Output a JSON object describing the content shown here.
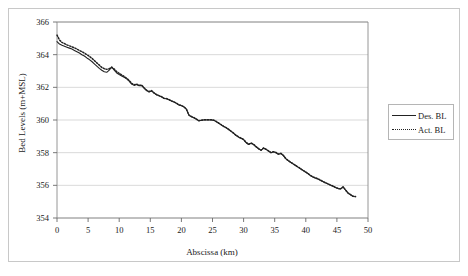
{
  "chart_data": {
    "type": "line",
    "title": "",
    "xlabel": "Abscissa (km)",
    "ylabel": "Bed Levels (m+MSL)",
    "xlim": [
      0,
      50
    ],
    "ylim": [
      354,
      366
    ],
    "xticks": [
      0,
      5,
      10,
      15,
      20,
      25,
      30,
      35,
      40,
      45,
      50
    ],
    "yticks": [
      354,
      356,
      358,
      360,
      362,
      364,
      366
    ],
    "grid": "horizontal",
    "legend_position": "right",
    "series": [
      {
        "name": "Des. BL",
        "style": "solid",
        "color": "#222222",
        "x": [
          0.0,
          0.4,
          0.8,
          1.2,
          1.6,
          2.0,
          2.4,
          2.8,
          3.2,
          3.6,
          4.0,
          4.4,
          4.8,
          5.2,
          5.6,
          6.0,
          6.4,
          6.8,
          7.2,
          7.6,
          8.0,
          8.4,
          8.8,
          9.2,
          9.6,
          10.0,
          10.4,
          10.8,
          11.2,
          11.6,
          12.0,
          12.4,
          12.8,
          13.2,
          13.6,
          14.0,
          14.4,
          14.8,
          15.2,
          15.6,
          16.0,
          16.4,
          16.8,
          17.2,
          17.6,
          18.0,
          18.4,
          18.8,
          19.2,
          19.6,
          20.0,
          20.4,
          20.8,
          21.2,
          21.6,
          22.0,
          22.4,
          22.8,
          23.2,
          23.6,
          24.0,
          24.4,
          24.8,
          25.2,
          25.6,
          26.0,
          26.4,
          26.8,
          27.2,
          27.6,
          28.0,
          28.4,
          28.8,
          29.2,
          29.6,
          30.0,
          30.4,
          30.8,
          31.2,
          31.6,
          32.0,
          32.4,
          32.8,
          33.2,
          33.6,
          34.0,
          34.4,
          34.8,
          35.2,
          35.6,
          36.0,
          36.4,
          36.8,
          37.2,
          37.6,
          38.0,
          38.4,
          38.8,
          39.2,
          39.6,
          40.0,
          40.4,
          40.8,
          41.2,
          41.6,
          42.0,
          42.4,
          42.8,
          43.2,
          43.6,
          44.0,
          44.4,
          44.8,
          45.2,
          45.6,
          46.0,
          46.4,
          46.8,
          47.2,
          47.6,
          48.0
        ],
        "y": [
          364.8,
          364.65,
          364.58,
          364.52,
          364.46,
          364.4,
          364.34,
          364.26,
          364.18,
          364.1,
          364.0,
          363.92,
          363.8,
          363.7,
          363.58,
          363.44,
          363.3,
          363.16,
          363.05,
          362.95,
          362.92,
          363.05,
          363.25,
          363.05,
          362.88,
          362.78,
          362.7,
          362.62,
          362.52,
          362.38,
          362.2,
          362.12,
          362.18,
          362.1,
          362.12,
          361.95,
          361.8,
          361.72,
          361.78,
          361.65,
          361.55,
          361.48,
          361.42,
          361.32,
          361.3,
          361.24,
          361.16,
          361.1,
          361.02,
          360.92,
          360.88,
          360.8,
          360.66,
          360.3,
          360.2,
          360.14,
          360.05,
          359.95,
          359.98,
          360.0,
          360.0,
          360.0,
          360.0,
          359.98,
          359.9,
          359.8,
          359.7,
          359.6,
          359.52,
          359.42,
          359.3,
          359.18,
          359.05,
          358.95,
          358.88,
          358.8,
          358.62,
          358.5,
          358.58,
          358.5,
          358.36,
          358.24,
          358.14,
          358.28,
          358.2,
          358.1,
          358.0,
          358.05,
          358.0,
          357.9,
          357.95,
          357.82,
          357.62,
          357.5,
          357.4,
          357.3,
          357.2,
          357.1,
          357.0,
          356.9,
          356.8,
          356.7,
          356.58,
          356.5,
          356.44,
          356.38,
          356.3,
          356.22,
          356.14,
          356.08,
          356.0,
          355.94,
          355.86,
          355.8,
          355.78,
          355.9,
          355.7,
          355.52,
          355.42,
          355.32,
          355.3
        ]
      },
      {
        "name": "Act. BL",
        "style": "dotted",
        "color": "#222222",
        "x": [
          0.0,
          0.4,
          0.8,
          1.2,
          1.6,
          2.0,
          2.4,
          2.8,
          3.2,
          3.6,
          4.0,
          4.4,
          4.8,
          5.2,
          5.6,
          6.0,
          6.4,
          6.8,
          7.2,
          7.6,
          8.0,
          8.4,
          8.8,
          9.2,
          9.6,
          10.0,
          10.4,
          10.8,
          11.2,
          11.6,
          12.0,
          12.4,
          12.8,
          13.2,
          13.6,
          14.0,
          14.4,
          14.8,
          15.2,
          15.6,
          16.0,
          16.4,
          16.8,
          17.2,
          17.6,
          18.0,
          18.4,
          18.8,
          19.2,
          19.6,
          20.0,
          20.4,
          20.8,
          21.2,
          21.6,
          22.0,
          22.4,
          22.8,
          23.2,
          23.6,
          24.0,
          24.4,
          24.8,
          25.2,
          25.6,
          26.0,
          26.4,
          26.8,
          27.2,
          27.6,
          28.0,
          28.4,
          28.8,
          29.2,
          29.6,
          30.0,
          30.4,
          30.8,
          31.2,
          31.6,
          32.0,
          32.4,
          32.8,
          33.2,
          33.6,
          34.0,
          34.4,
          34.8,
          35.2,
          35.6,
          36.0,
          36.4,
          36.8,
          37.2,
          37.6,
          38.0,
          38.4,
          38.8,
          39.2,
          39.6,
          40.0,
          40.4,
          40.8,
          41.2,
          41.6,
          42.0,
          42.4,
          42.8,
          43.2,
          43.6,
          44.0,
          44.4,
          44.8,
          45.2,
          45.6,
          46.0,
          46.4,
          46.8,
          47.2,
          47.6,
          48.0
        ],
        "y": [
          365.2,
          364.9,
          364.75,
          364.68,
          364.6,
          364.54,
          364.48,
          364.42,
          364.34,
          364.26,
          364.18,
          364.1,
          364.0,
          363.9,
          363.78,
          363.64,
          363.5,
          363.36,
          363.22,
          363.14,
          363.1,
          363.14,
          363.22,
          363.12,
          362.96,
          362.86,
          362.76,
          362.66,
          362.56,
          362.42,
          362.24,
          362.16,
          362.2,
          362.12,
          362.14,
          361.97,
          361.82,
          361.74,
          361.8,
          361.66,
          361.56,
          361.49,
          361.43,
          361.33,
          361.31,
          361.25,
          361.17,
          361.11,
          361.03,
          360.93,
          360.89,
          360.81,
          360.67,
          360.31,
          360.21,
          360.15,
          360.06,
          359.96,
          359.99,
          360.01,
          360.01,
          360.01,
          360.01,
          359.99,
          359.91,
          359.81,
          359.71,
          359.61,
          359.53,
          359.43,
          359.31,
          359.19,
          359.06,
          358.96,
          358.89,
          358.81,
          358.63,
          358.51,
          358.59,
          358.51,
          358.37,
          358.25,
          358.15,
          358.29,
          358.21,
          358.11,
          358.01,
          358.06,
          358.01,
          357.91,
          357.96,
          357.83,
          357.63,
          357.51,
          357.41,
          357.31,
          357.21,
          357.11,
          357.01,
          356.91,
          356.81,
          356.71,
          356.59,
          356.51,
          356.45,
          356.39,
          356.31,
          356.23,
          356.15,
          356.09,
          356.01,
          355.95,
          355.87,
          355.81,
          355.79,
          355.91,
          355.71,
          355.53,
          355.43,
          355.33,
          355.31
        ]
      }
    ]
  },
  "legend": {
    "entries": [
      {
        "label": "Des. BL"
      },
      {
        "label": "Act. BL"
      }
    ]
  }
}
